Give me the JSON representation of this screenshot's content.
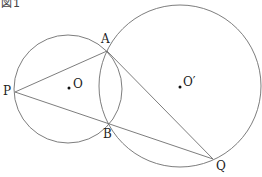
{
  "figure": {
    "title": "図1",
    "stroke_color": "#6e6e6e",
    "point_color": "#111111"
  },
  "circles": [
    {
      "name": "O",
      "cx": 68,
      "cy": 89,
      "r": 54
    },
    {
      "name": "O′",
      "cx": 180,
      "cy": 86,
      "r": 81
    }
  ],
  "points": {
    "A": {
      "label": "A",
      "x": 107,
      "y": 51
    },
    "B": {
      "label": "B",
      "x": 109,
      "y": 124
    },
    "P": {
      "label": "P",
      "x": 15,
      "y": 92
    },
    "Q": {
      "label": "Q",
      "x": 213,
      "y": 159
    },
    "O": {
      "label": "O",
      "x": 69,
      "y": 88
    },
    "O_prime": {
      "label": "O′",
      "x": 180,
      "y": 87
    }
  },
  "segments": [
    [
      "P",
      "A"
    ],
    [
      "P",
      "Q"
    ],
    [
      "A",
      "Q"
    ]
  ]
}
